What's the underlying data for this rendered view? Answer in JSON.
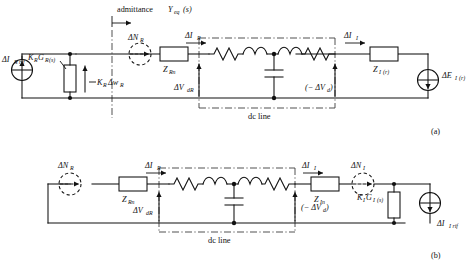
{
  "figure": {
    "title_top": "admittance",
    "title_top_var": "Y",
    "title_top_sub": "eq",
    "title_top_arg": "(s)",
    "dc_line_label": "dc line",
    "panel_a_tag": "(a)",
    "panel_b_tag": "(b)"
  },
  "panel_a": {
    "tag": "(a)",
    "current_source": {
      "symbol": "ΔI",
      "sub": "R rif",
      "name": "rectifier-reference-current-source"
    },
    "gain_block": {
      "symbol": "K",
      "sub1": "R",
      "symbol2": "G",
      "sub2": "R",
      "arg": "(s)"
    },
    "gain_arrow_label": {
      "symbol": "K",
      "sub1": "R",
      "symbol2": "Δw",
      "sub2": "R"
    },
    "delta_n_r": {
      "symbol": "ΔN",
      "sub": "R"
    },
    "delta_i_r": {
      "symbol": "ΔI",
      "sub": "R"
    },
    "z_rn": {
      "symbol": "Z",
      "sub": "Rn"
    },
    "delta_v_dr": {
      "symbol": "ΔV",
      "sub": "dR"
    },
    "delta_i_i": {
      "symbol": "ΔI",
      "sub": "I"
    },
    "neg_delta_v_d": {
      "text": "(− ΔV",
      "sub": "d",
      "tail": ")"
    },
    "z_i_r": {
      "symbol": "Z",
      "sub": "I",
      "arg": "(r)"
    },
    "delta_e_i_r": {
      "symbol": "ΔE",
      "sub": "I",
      "arg": "(r)"
    },
    "dc_line_label": "dc line"
  },
  "panel_b": {
    "tag": "(b)",
    "delta_n_r": {
      "symbol": "ΔN",
      "sub": "R"
    },
    "delta_i_r": {
      "symbol": "ΔI",
      "sub": "R"
    },
    "z_rn": {
      "symbol": "Z",
      "sub": "Rn"
    },
    "delta_v_dr": {
      "symbol": "ΔV",
      "sub": "dR"
    },
    "delta_i_i": {
      "symbol": "ΔI",
      "sub": "I"
    },
    "neg_delta_v_d": {
      "text": "(− ΔV",
      "sub": "d",
      "tail": ")"
    },
    "z_in": {
      "symbol": "Z",
      "sub": "In"
    },
    "delta_n_i": {
      "symbol": "ΔN",
      "sub": "I"
    },
    "gain_block": {
      "symbol": "K",
      "sub1": "I",
      "symbol2": "G",
      "sub2": "I",
      "arg": "(s)"
    },
    "current_source": {
      "symbol": "ΔI",
      "sub": "I rif"
    },
    "dc_line_label": "dc line"
  },
  "colors": {
    "ink": "#111111",
    "paper": "#ffffff",
    "boundary": "#333333"
  }
}
